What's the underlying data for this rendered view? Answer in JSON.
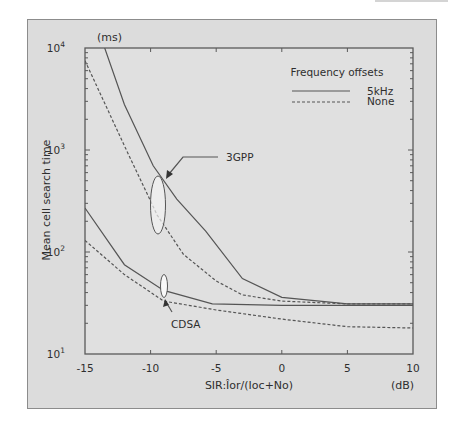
{
  "chart_data": {
    "type": "line",
    "title": "",
    "xlabel": "SIR:Îor/(Ioc+No)",
    "xunit": "(dB)",
    "ylabel": "Mean cell search time",
    "yunit": "(ms)",
    "yscale": "log",
    "xlim": [
      -15,
      10
    ],
    "ylim": [
      10,
      10000
    ],
    "x_ticks": [
      -15,
      -10,
      -5,
      0,
      5,
      10
    ],
    "x_tick_labels": [
      "-15",
      "-10",
      "-5",
      "0",
      "5",
      "10"
    ],
    "y_ticks": [
      10,
      100,
      1000,
      10000
    ],
    "y_tick_labels": [
      {
        "base": "10",
        "exp": "1"
      },
      {
        "base": "10",
        "exp": "2"
      },
      {
        "base": "10",
        "exp": "3"
      },
      {
        "base": "10",
        "exp": "4"
      }
    ],
    "grid": false,
    "legend": {
      "title": "Frequency offsets",
      "position": "upper right",
      "entries": [
        {
          "label": "5kHz",
          "style": "solid"
        },
        {
          "label": "None",
          "style": "dashed"
        }
      ]
    },
    "series": [
      {
        "name": "3GPP, 5kHz",
        "group": "3GPP",
        "style": "solid",
        "x": [
          -13.5,
          -12,
          -9.8,
          -8,
          -5.8,
          -3,
          0,
          5,
          10
        ],
        "y": [
          10000,
          2800,
          700,
          330,
          160,
          55,
          36,
          31,
          31
        ]
      },
      {
        "name": "3GPP, None",
        "group": "3GPP",
        "style": "dashed",
        "x": [
          -15,
          -12,
          -9.5,
          -7.5,
          -5,
          -3,
          0,
          5,
          10
        ],
        "y": [
          7500,
          1100,
          230,
          95,
          52,
          38,
          33,
          31,
          31
        ]
      },
      {
        "name": "CDSA, 5kHz",
        "group": "CDSA",
        "style": "solid",
        "x": [
          -15,
          -12,
          -9,
          -5.3,
          0,
          5,
          10
        ],
        "y": [
          270,
          75,
          42,
          31,
          30,
          30,
          30
        ]
      },
      {
        "name": "CDSA, None",
        "group": "CDSA",
        "style": "dashed",
        "x": [
          -15,
          -12,
          -9,
          -5,
          0,
          5,
          10
        ],
        "y": [
          130,
          60,
          33,
          27,
          22,
          18.5,
          18
        ]
      }
    ],
    "annotations": [
      {
        "text": "3GPP",
        "target_x": -9.7,
        "target_y": 300,
        "shape": "ellipse"
      },
      {
        "text": "CDSA",
        "target_x": -9.3,
        "target_y": 37,
        "shape": "ellipse"
      }
    ]
  },
  "colors": {
    "panel_bg": "#dcdcdc",
    "plot_bg": "#e0e0e0",
    "line": "#555555",
    "ellipse_fill": "#f2f2f2"
  }
}
